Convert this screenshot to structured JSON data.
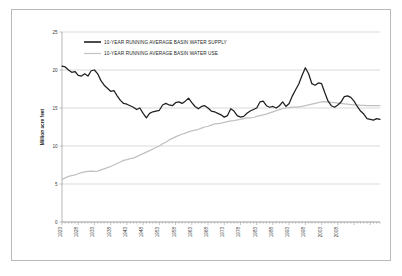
{
  "chart_data": {
    "type": "line",
    "title": "",
    "xlabel": "",
    "ylabel": "Million acre feet",
    "ylim": [
      0,
      25
    ],
    "y_ticks": [
      "0",
      "5",
      "10",
      "15",
      "20",
      "25"
    ],
    "y_tick_values": [
      0,
      5,
      10,
      15,
      20,
      25
    ],
    "grid": true,
    "legend_position": "top-left-inside",
    "x_tick_labels": [
      "1923",
      "1928",
      "1933",
      "1938",
      "1943",
      "1948",
      "1953",
      "1958",
      "1963",
      "1968",
      "1973",
      "1978",
      "1983",
      "1988",
      "1993",
      "1998",
      "2003",
      "2008"
    ],
    "x_start_year": 1923,
    "x_end_year": 2011,
    "series": [
      {
        "name": "10-YEAR RUNNING AVERAGE BASIN WATER SUPPLY",
        "color": "#1f1f1f",
        "values": [
          20.5,
          20.4,
          20.0,
          19.7,
          19.8,
          19.3,
          19.2,
          19.5,
          19.2,
          19.9,
          20.0,
          19.5,
          18.6,
          18.0,
          17.6,
          17.2,
          17.3,
          16.6,
          16.0,
          15.6,
          15.5,
          15.3,
          15.1,
          14.8,
          15.0,
          14.3,
          13.7,
          14.3,
          14.5,
          14.6,
          14.7,
          15.4,
          15.6,
          15.4,
          15.3,
          15.7,
          15.8,
          15.6,
          15.9,
          16.3,
          15.7,
          15.2,
          14.9,
          15.2,
          15.3,
          15.0,
          14.6,
          14.5,
          14.3,
          14.1,
          13.8,
          14.0,
          14.9,
          14.6,
          14.0,
          13.8,
          13.9,
          14.3,
          14.6,
          14.8,
          15.0,
          15.8,
          15.9,
          15.3,
          15.1,
          15.2,
          15.0,
          15.3,
          15.8,
          15.2,
          15.6,
          16.6,
          17.4,
          18.2,
          19.3,
          20.3,
          19.5,
          18.2,
          18.0,
          18.3,
          18.2,
          17.0,
          15.9,
          15.3,
          15.1,
          15.4,
          15.8,
          16.5,
          16.6,
          16.4,
          15.9,
          15.2,
          14.6,
          14.2,
          13.6,
          13.5,
          13.4,
          13.6,
          13.5
        ]
      },
      {
        "name": "10-YEAR RUNNING AVERAGE BASIN WATER USE",
        "color": "#c0c0c0",
        "values": [
          5.6,
          5.8,
          6.0,
          6.1,
          6.2,
          6.35,
          6.5,
          6.6,
          6.65,
          6.7,
          6.65,
          6.7,
          6.85,
          7.0,
          7.15,
          7.3,
          7.5,
          7.7,
          7.9,
          8.1,
          8.2,
          8.35,
          8.4,
          8.6,
          8.8,
          9.0,
          9.2,
          9.4,
          9.6,
          9.8,
          10.0,
          10.3,
          10.5,
          10.8,
          11.0,
          11.2,
          11.4,
          11.55,
          11.7,
          11.85,
          12.0,
          12.1,
          12.2,
          12.35,
          12.5,
          12.6,
          12.75,
          12.9,
          12.95,
          13.0,
          13.1,
          13.2,
          13.3,
          13.35,
          13.45,
          13.5,
          13.6,
          13.7,
          13.7,
          13.75,
          13.9,
          14.0,
          14.1,
          14.2,
          14.35,
          14.5,
          14.65,
          14.8,
          14.9,
          15.0,
          15.05,
          15.1,
          15.1,
          15.15,
          15.2,
          15.3,
          15.4,
          15.5,
          15.6,
          15.7,
          15.8,
          15.85,
          15.8,
          15.75,
          15.7,
          15.65,
          15.6,
          15.55,
          15.5,
          15.45,
          15.4,
          15.4,
          15.35,
          15.35,
          15.3,
          15.3,
          15.3,
          15.3,
          15.3
        ]
      }
    ]
  },
  "legend": {
    "items": [
      {
        "label": "10-YEAR RUNNING  AVERAGE  BASIN WATER SUPPLY",
        "swatch": "solid-black-line"
      },
      {
        "label": "10-YEAR RUNNING  AVERAGE  BASIN WATER USE",
        "swatch": "solid-gray-line"
      }
    ]
  },
  "axes": {
    "y_title": "Million acre feet"
  }
}
